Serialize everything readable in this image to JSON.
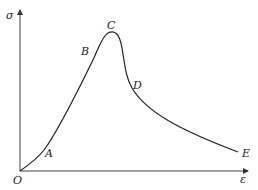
{
  "diagram": {
    "type": "stress-strain curve",
    "axes": {
      "y_label": "σ",
      "x_label": "ε",
      "origin_label": "O"
    },
    "points": [
      {
        "id": "A",
        "label": "A"
      },
      {
        "id": "B",
        "label": "B"
      },
      {
        "id": "C",
        "label": "C"
      },
      {
        "id": "D",
        "label": "D"
      },
      {
        "id": "E",
        "label": "E"
      }
    ],
    "colors": {
      "line": "#222222",
      "axis": "#444444",
      "background": "#ffffff"
    }
  }
}
